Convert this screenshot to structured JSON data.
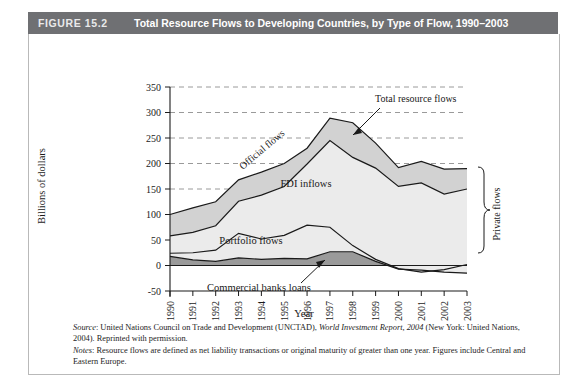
{
  "header": {
    "figure_number": "FIGURE 15.2",
    "title": "Total Resource Flows to Developing Countries, by Type of Flow, 1990–2003",
    "bar_color": "#6f7073"
  },
  "annotations": {
    "total_resource_flows": "Total resource flows",
    "official_flows": "Official flows",
    "fdi_inflows": "FDI inflows",
    "portfolio_flows": "Portfolio flows",
    "commercial_banks_loans": "Commercial banks loans",
    "private_flows": "Private flows"
  },
  "caption": {
    "source_label": "Source",
    "source_text_a": ": United Nations Council on Trade and Development (UNCTAD), ",
    "source_italic": "World Investment Report, 2004",
    "source_text_b": " (New York: United Nations, 2004). Reprinted with permission.",
    "notes_label": "Notes",
    "notes_text": ": Resource flows are defined as net liability transactions or original maturity of greater than one year. Figures include Central and Eastern Europe."
  },
  "chart_data": {
    "type": "area",
    "title": "Total Resource Flows to Developing Countries, by Type of Flow, 1990–2003",
    "xlabel": "Year",
    "ylabel": "Billions of dollars",
    "ylim": [
      -50,
      350
    ],
    "yticks": [
      -50,
      0,
      50,
      100,
      150,
      200,
      250,
      300,
      350
    ],
    "ytick_labels": [
      "-50",
      "0",
      "50",
      "100",
      "150",
      "200",
      "250",
      "300",
      "350"
    ],
    "grid": true,
    "grid_style": "dashed-horizontal",
    "legend_position": "inline-annotations",
    "categories": [
      "1990",
      "1991",
      "1992",
      "1993",
      "1994",
      "1995",
      "1996",
      "1997",
      "1998",
      "1999",
      "2000",
      "2001",
      "2002",
      "2003"
    ],
    "stack_order_bottom_to_top": [
      "Commercial banks loans",
      "Portfolio flows",
      "FDI inflows",
      "Official flows"
    ],
    "series": [
      {
        "name": "Commercial banks loans",
        "fill": "#9a9a9a",
        "values": [
          18,
          11,
          8,
          15,
          12,
          14,
          13,
          27,
          27,
          8,
          -7,
          -9,
          -13,
          -15
        ]
      },
      {
        "name": "Portfolio flows",
        "fill": "#ebebeb",
        "values": [
          6,
          14,
          22,
          48,
          40,
          45,
          66,
          48,
          12,
          4,
          1,
          -4,
          5,
          17
        ]
      },
      {
        "name": "FDI inflows",
        "fill": "#ebebeb",
        "values": [
          34,
          40,
          48,
          63,
          86,
          96,
          120,
          170,
          173,
          179,
          161,
          175,
          148,
          148
        ]
      },
      {
        "name": "Official flows",
        "fill": "#d2d2d2",
        "values": [
          42,
          48,
          47,
          42,
          45,
          45,
          31,
          44,
          68,
          49,
          37,
          42,
          49,
          40
        ]
      }
    ],
    "totals": [
      100,
      113,
      125,
      168,
      183,
      200,
      230,
      289,
      280,
      240,
      192,
      204,
      189,
      190
    ],
    "cumulative_upper_boundaries": {
      "commercial_top": [
        18,
        11,
        8,
        15,
        12,
        14,
        13,
        27,
        27,
        8,
        -7,
        -9,
        -13,
        -15
      ],
      "portfolio_top": [
        24,
        25,
        30,
        63,
        52,
        59,
        79,
        75,
        39,
        12,
        -6,
        -13,
        -8,
        2
      ],
      "fdi_top": [
        58,
        65,
        78,
        126,
        138,
        155,
        199,
        245,
        212,
        191,
        155,
        162,
        140,
        150
      ],
      "official_top": [
        100,
        113,
        125,
        168,
        183,
        200,
        230,
        289,
        280,
        240,
        192,
        204,
        189,
        190
      ]
    },
    "private_flows_bracket": {
      "label": "Private flows",
      "covers": [
        "Commercial banks loans",
        "Portfolio flows",
        "FDI inflows"
      ]
    }
  }
}
